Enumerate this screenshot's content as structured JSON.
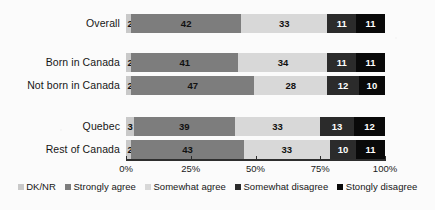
{
  "chart_data": {
    "type": "bar",
    "orientation": "horizontal",
    "stacked": true,
    "title": "",
    "subtitle": "",
    "xlabel": "",
    "ylabel": "",
    "xlim": [
      0,
      100
    ],
    "grid": false,
    "legend_position": "bottom",
    "categories": [
      "Overall",
      "Born in Canada",
      "Not born in Canada",
      "Quebec",
      "Rest of Canada"
    ],
    "series": [
      {
        "name": "DK/NR",
        "color": "#c9c9c9",
        "values": [
          2,
          2,
          2,
          3,
          2
        ]
      },
      {
        "name": "Strongly agree",
        "color": "#7d7d7d",
        "values": [
          42,
          41,
          47,
          39,
          43
        ]
      },
      {
        "name": "Somewhat agree",
        "color": "#d8d8d8",
        "values": [
          33,
          34,
          28,
          33,
          33
        ]
      },
      {
        "name": "Somewhat disagree",
        "color": "#2b2b2b",
        "values": [
          11,
          11,
          12,
          13,
          10
        ]
      },
      {
        "name": "Stongly disagree",
        "color": "#090909",
        "values": [
          11,
          11,
          10,
          12,
          11
        ]
      }
    ],
    "xticks": [
      0,
      25,
      50,
      75,
      100
    ],
    "xticklabels": [
      "0%",
      "25%",
      "50%",
      "75%",
      "100%"
    ]
  },
  "rows": [
    {
      "label": "Overall",
      "top": 14,
      "segments": [
        {
          "series": "DK/NR",
          "value": 2,
          "label": "2",
          "color": "#c9c9c9"
        },
        {
          "series": "Strongly agree",
          "value": 42,
          "label": "42",
          "color": "#7d7d7d"
        },
        {
          "series": "Somewhat agree",
          "value": 33,
          "label": "33",
          "color": "#d8d8d8"
        },
        {
          "series": "Somewhat disagree",
          "value": 11,
          "label": "11",
          "color": "#2b2b2b"
        },
        {
          "series": "Stongly disagree",
          "value": 11,
          "label": "11",
          "color": "#090909"
        }
      ]
    },
    {
      "label": "Born in Canada",
      "top": 53,
      "segments": [
        {
          "series": "DK/NR",
          "value": 2,
          "label": "2",
          "color": "#c9c9c9"
        },
        {
          "series": "Strongly agree",
          "value": 41,
          "label": "41",
          "color": "#7d7d7d"
        },
        {
          "series": "Somewhat agree",
          "value": 34,
          "label": "34",
          "color": "#d8d8d8"
        },
        {
          "series": "Somewhat disagree",
          "value": 11,
          "label": "11",
          "color": "#2b2b2b"
        },
        {
          "series": "Stongly disagree",
          "value": 11,
          "label": "11",
          "color": "#090909"
        }
      ]
    },
    {
      "label": "Not born in Canada",
      "top": 76,
      "segments": [
        {
          "series": "DK/NR",
          "value": 2,
          "label": "2",
          "color": "#c9c9c9"
        },
        {
          "series": "Strongly agree",
          "value": 47,
          "label": "47",
          "color": "#7d7d7d"
        },
        {
          "series": "Somewhat agree",
          "value": 28,
          "label": "28",
          "color": "#d8d8d8"
        },
        {
          "series": "Somewhat disagree",
          "value": 12,
          "label": "12",
          "color": "#2b2b2b"
        },
        {
          "series": "Stongly disagree",
          "value": 10,
          "label": "10",
          "color": "#090909"
        }
      ]
    },
    {
      "label": "Quebec",
      "top": 117,
      "segments": [
        {
          "series": "DK/NR",
          "value": 3,
          "label": "3",
          "color": "#c9c9c9"
        },
        {
          "series": "Strongly agree",
          "value": 39,
          "label": "39",
          "color": "#7d7d7d"
        },
        {
          "series": "Somewhat agree",
          "value": 33,
          "label": "33",
          "color": "#d8d8d8"
        },
        {
          "series": "Somewhat disagree",
          "value": 13,
          "label": "13",
          "color": "#2b2b2b"
        },
        {
          "series": "Stongly disagree",
          "value": 12,
          "label": "12",
          "color": "#090909"
        }
      ]
    },
    {
      "label": "Rest of Canada",
      "top": 140,
      "segments": [
        {
          "series": "DK/NR",
          "value": 2,
          "label": "2",
          "color": "#c9c9c9"
        },
        {
          "series": "Strongly agree",
          "value": 43,
          "label": "43",
          "color": "#7d7d7d"
        },
        {
          "series": "Somewhat agree",
          "value": 33,
          "label": "33",
          "color": "#d8d8d8"
        },
        {
          "series": "Somewhat disagree",
          "value": 10,
          "label": "10",
          "color": "#2b2b2b"
        },
        {
          "series": "Stongly disagree",
          "value": 11,
          "label": "11",
          "color": "#090909"
        }
      ]
    }
  ],
  "axis": {
    "ticks": [
      {
        "value": 0,
        "label": "0%"
      },
      {
        "value": 25,
        "label": "25%"
      },
      {
        "value": 50,
        "label": "50%"
      },
      {
        "value": 75,
        "label": "75%"
      },
      {
        "value": 100,
        "label": "100%"
      }
    ]
  },
  "legend": {
    "items": [
      {
        "label": "DK/NR",
        "color": "#c9c9c9"
      },
      {
        "label": "Strongly agree",
        "color": "#7d7d7d"
      },
      {
        "label": "Somewhat agree",
        "color": "#d8d8d8"
      },
      {
        "label": "Somewhat disagree",
        "color": "#2b2b2b"
      },
      {
        "label": "Stongly disagree",
        "color": "#090909"
      }
    ]
  }
}
